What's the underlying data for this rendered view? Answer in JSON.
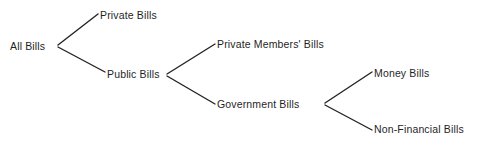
{
  "diagram": {
    "type": "tree-diagram",
    "background_color": "#ffffff",
    "line_color": "#232323",
    "text_color": "#1f1f1f",
    "nodes": [
      {
        "id": "all-bills",
        "label": "All Bills",
        "level": 0
      },
      {
        "id": "private-bills",
        "label": "Private Bills",
        "level": 1
      },
      {
        "id": "public-bills",
        "label": "Public Bills",
        "level": 1
      },
      {
        "id": "private-members",
        "label": "Private Members' Bills",
        "level": 2
      },
      {
        "id": "government-bills",
        "label": "Government Bills",
        "level": 2
      },
      {
        "id": "money-bills",
        "label": "Money Bills",
        "level": 3
      },
      {
        "id": "non-financial",
        "label": "Non-Financial Bills",
        "level": 3
      }
    ],
    "edges": [
      {
        "from": "all-bills",
        "to": "private-bills"
      },
      {
        "from": "all-bills",
        "to": "public-bills"
      },
      {
        "from": "public-bills",
        "to": "private-members"
      },
      {
        "from": "public-bills",
        "to": "government-bills"
      },
      {
        "from": "government-bills",
        "to": "money-bills"
      },
      {
        "from": "government-bills",
        "to": "non-financial"
      }
    ]
  }
}
